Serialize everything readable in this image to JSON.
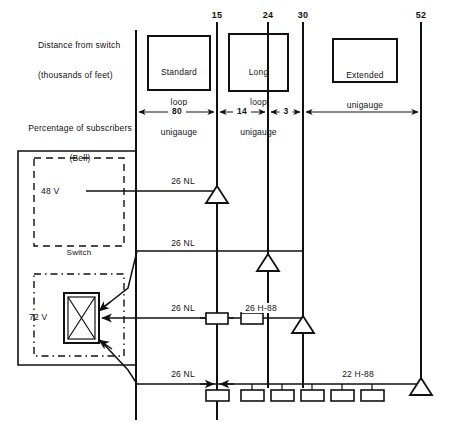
{
  "figure": {
    "type": "engineering-schematic",
    "width": 449,
    "height": 423,
    "stroke_color": "#111111",
    "background_color": "#ffffff"
  },
  "axis": {
    "label_line1": "Distance from switch",
    "label_line2": "(thousands of feet)",
    "ticks": [
      {
        "value": "15",
        "x": 217
      },
      {
        "value": "24",
        "x": 268
      },
      {
        "value": "30",
        "x": 303
      },
      {
        "value": "52",
        "x": 421
      }
    ]
  },
  "percentage": {
    "label_line1": "Percentage of subscribers",
    "label_line2": "(Bell)",
    "segments": [
      {
        "value": "80",
        "from_x": 136,
        "to_x": 217
      },
      {
        "value": "14",
        "from_x": 217,
        "to_x": 268
      },
      {
        "value": "3",
        "from_x": 268,
        "to_x": 303
      },
      {
        "value": "",
        "from_x": 303,
        "to_x": 421
      }
    ]
  },
  "plan_boxes": [
    {
      "id": "standard-loop-unigauge",
      "lines": [
        "Standard",
        "loop",
        "unigauge"
      ],
      "x": 148,
      "y": 36,
      "w": 62,
      "h": 54
    },
    {
      "id": "long-loop-unigauge",
      "lines": [
        "Long",
        "loop",
        "unigauge"
      ],
      "x": 229,
      "y": 34,
      "w": 59,
      "h": 57
    },
    {
      "id": "extended-unigauge",
      "lines": [
        "Extended",
        "unigauge"
      ],
      "x": 333,
      "y": 39,
      "w": 64,
      "h": 43
    }
  ],
  "switch": {
    "label": "Switch",
    "battery_48": "48 V",
    "battery_72": "72 V"
  },
  "cable_labels": [
    {
      "text": "26 NL",
      "x": 183,
      "y": 181
    },
    {
      "text": "26 NL",
      "x": 183,
      "y": 243
    },
    {
      "text": "26 NL",
      "x": 183,
      "y": 307
    },
    {
      "text": "26 NL",
      "x": 183,
      "y": 373
    },
    {
      "text": "26 H-88",
      "x": 258,
      "y": 307
    },
    {
      "text": "22 H-88",
      "x": 355,
      "y": 373
    }
  ],
  "repeaters": [
    {
      "id": "repeater-15",
      "x": 217,
      "y": 200
    },
    {
      "id": "repeater-24",
      "x": 268,
      "y": 268
    },
    {
      "id": "repeater-30",
      "x": 303,
      "y": 330
    },
    {
      "id": "repeater-52",
      "x": 421,
      "y": 392
    }
  ],
  "loading_coils": {
    "row_26h88": [
      {
        "x": 217,
        "y": 319
      },
      {
        "x": 252,
        "y": 319
      }
    ],
    "row_22h88": [
      {
        "x": 217,
        "y": 390
      },
      {
        "x": 252,
        "y": 390
      },
      {
        "x": 282,
        "y": 390
      },
      {
        "x": 312,
        "y": 390
      },
      {
        "x": 342,
        "y": 390
      },
      {
        "x": 372,
        "y": 390
      }
    ]
  }
}
